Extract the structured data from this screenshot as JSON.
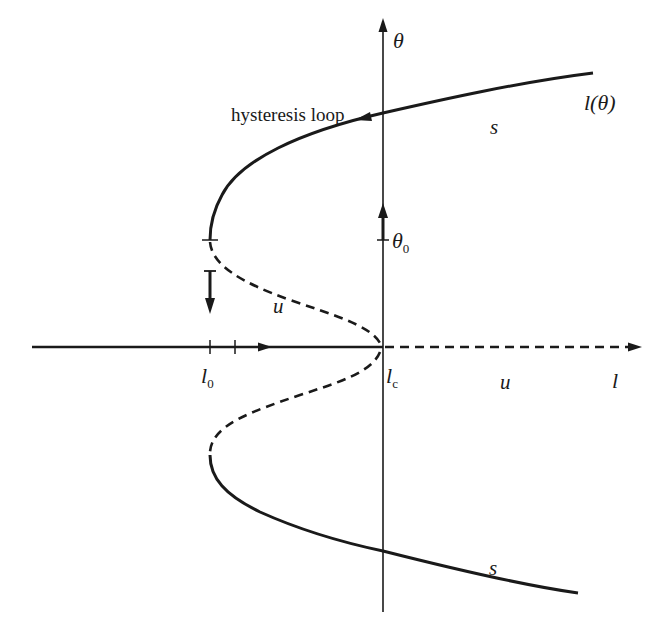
{
  "diagram": {
    "type": "bifurcation-diagram",
    "colors": {
      "ink": "#1a1a1a",
      "background": "#ffffff"
    },
    "axes": {
      "vertical_label": "θ",
      "horizontal_label": "l"
    },
    "labels": {
      "curve_name": "l(θ)",
      "hysteresis": "hysteresis loop",
      "stable_upper": "s",
      "stable_lower": "s",
      "unstable_branch": "u",
      "unstable_axis": "u",
      "theta0": "θ",
      "theta0_sub": "0",
      "l0": "l",
      "l0_sub": "0",
      "lc": "l",
      "lc_sub": "c"
    },
    "branches": [
      {
        "name": "upper stable branch",
        "style": "solid",
        "stability": "s"
      },
      {
        "name": "upper unstable branch",
        "style": "dashed",
        "stability": "u"
      },
      {
        "name": "lower unstable branch",
        "style": "dashed",
        "stability": "u"
      },
      {
        "name": "lower stable branch",
        "style": "solid",
        "stability": "s"
      },
      {
        "name": "trivial branch l < l_c",
        "style": "solid",
        "stability": "s"
      },
      {
        "name": "trivial branch l > l_c",
        "style": "dashed",
        "stability": "u"
      }
    ]
  }
}
